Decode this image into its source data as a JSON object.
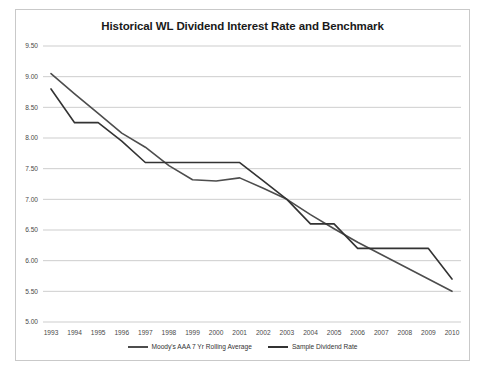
{
  "chart_data": {
    "type": "line",
    "title": "Historical WL Dividend Interest Rate and Benchmark",
    "xlabel": "",
    "ylabel": "",
    "x": [
      1993,
      1994,
      1995,
      1996,
      1997,
      1998,
      1999,
      2000,
      2001,
      2002,
      2003,
      2004,
      2005,
      2006,
      2007,
      2008,
      2009,
      2010
    ],
    "categories": [
      "1993",
      "1994",
      "1995",
      "1996",
      "1997",
      "1998",
      "1999",
      "2000",
      "2001",
      "2002",
      "2003",
      "2004",
      "2005",
      "2006",
      "2007",
      "2008",
      "2009",
      "2010"
    ],
    "ylim": [
      5.0,
      9.5
    ],
    "yticks": [
      9.5,
      9.0,
      8.5,
      8.0,
      7.5,
      7.0,
      6.5,
      6.0,
      5.5,
      5.0
    ],
    "ytick_labels": [
      "9.50",
      "9.00",
      "8.50",
      "8.00",
      "7.50",
      "7.00",
      "6.50",
      "6.00",
      "5.50",
      "5.00"
    ],
    "grid": true,
    "legend_position": "bottom",
    "series": [
      {
        "name": "Moody's AAA 7 Yr Rolling Average",
        "color": "#4d4d4d",
        "values": [
          9.05,
          8.72,
          8.4,
          8.08,
          7.85,
          7.55,
          7.32,
          7.3,
          7.35,
          7.18,
          7.0,
          6.75,
          6.52,
          6.3,
          6.1,
          5.9,
          5.7,
          5.5
        ]
      },
      {
        "name": "Sample Dividend Rate",
        "color": "#333333",
        "values": [
          8.8,
          8.25,
          8.25,
          7.95,
          7.6,
          7.6,
          7.6,
          7.6,
          7.6,
          7.3,
          7.0,
          6.6,
          6.6,
          6.2,
          6.2,
          6.2,
          6.2,
          5.7
        ]
      }
    ]
  }
}
